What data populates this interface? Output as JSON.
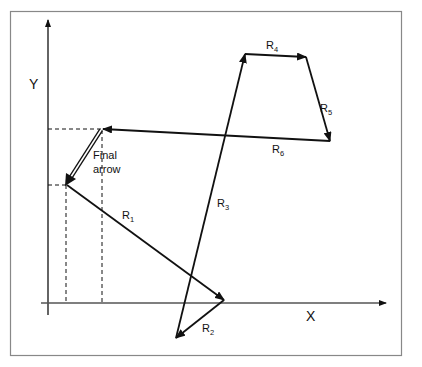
{
  "diagram": {
    "axes": {
      "x_label": "X",
      "y_label": "Y"
    },
    "vectors": [
      {
        "name": "R1",
        "base": "R",
        "sub": "1"
      },
      {
        "name": "R2",
        "base": "R",
        "sub": "2"
      },
      {
        "name": "R3",
        "base": "R",
        "sub": "3"
      },
      {
        "name": "R4",
        "base": "R",
        "sub": "4"
      },
      {
        "name": "R5",
        "base": "R",
        "sub": "5"
      },
      {
        "name": "R6",
        "base": "R",
        "sub": "6"
      }
    ],
    "final_arrow": {
      "line1": "Final",
      "line2": "arrow"
    },
    "colors": {
      "stroke": "#111111",
      "frame": "#888888",
      "background": "#ffffff"
    }
  }
}
